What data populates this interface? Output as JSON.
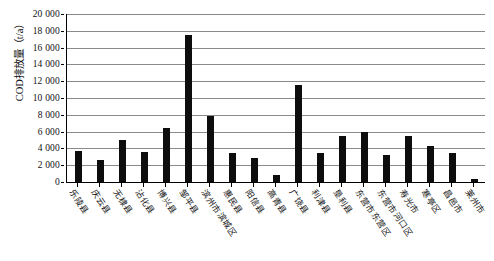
{
  "chart_data": {
    "type": "bar",
    "title": "",
    "xlabel": "",
    "ylabel": "COD排放量（t/a）",
    "ylim": [
      0,
      20000
    ],
    "ytick_step": 2000,
    "ytick_labels": [
      "20 000",
      "18 000",
      "16 000",
      "14 000",
      "12 000",
      "10 000",
      "8 000",
      "6 000",
      "4 000",
      "2 000",
      "0"
    ],
    "ytick_values": [
      20000,
      18000,
      16000,
      14000,
      12000,
      10000,
      8000,
      6000,
      4000,
      2000,
      0
    ],
    "grid": true,
    "grid_axis": "y",
    "legend": "none",
    "bar_color": "#0d0d0d",
    "categories": [
      "乐陵县",
      "庆云县",
      "无棣县",
      "沾化县",
      "博兴县",
      "邹平县",
      "滨州市滨城区",
      "惠民县",
      "阳信县",
      "高青县",
      "广饶县",
      "利津县",
      "垦利县",
      "东营市东营区",
      "东营市河口区",
      "寿光市",
      "寒亭区",
      "昌邑市",
      "莱州市"
    ],
    "values": [
      3700,
      2600,
      5000,
      3600,
      6400,
      17500,
      7800,
      3500,
      2800,
      800,
      11500,
      3400,
      5500,
      5900,
      3200,
      5500,
      4300,
      3500,
      400
    ]
  }
}
